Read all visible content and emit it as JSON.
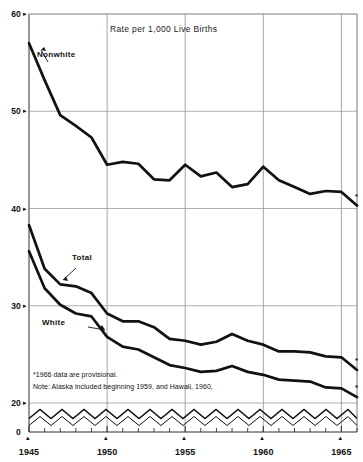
{
  "chart_data": {
    "type": "line",
    "title": "Rate per 1,000 Live Births",
    "xlabel": "",
    "ylabel": "",
    "xlim": [
      1945,
      1966
    ],
    "ylim": [
      20,
      60
    ],
    "y_broken_below": 20,
    "grid": true,
    "legend_position": "inline-annotations",
    "yticks": [
      "60",
      "50",
      "40",
      "30",
      "20",
      "0"
    ],
    "ytick_values": [
      60,
      50,
      40,
      30,
      20,
      0
    ],
    "xticks": [
      "1945",
      "1950",
      "1955",
      "1960",
      "1965"
    ],
    "xtick_values": [
      1945,
      1950,
      1955,
      1960,
      1965
    ],
    "x": [
      1945,
      1946,
      1947,
      1948,
      1949,
      1950,
      1951,
      1952,
      1953,
      1954,
      1955,
      1956,
      1957,
      1958,
      1959,
      1960,
      1961,
      1962,
      1963,
      1964,
      1965,
      1966
    ],
    "series": [
      {
        "name": "Nonwhite",
        "color": "#111111",
        "values": [
          57.0,
          53.2,
          49.6,
          48.5,
          47.3,
          44.5,
          44.8,
          44.6,
          43.0,
          42.9,
          44.5,
          43.3,
          43.7,
          42.2,
          42.5,
          44.3,
          42.9,
          42.2,
          41.5,
          41.8,
          41.7,
          40.3
        ]
      },
      {
        "name": "Total",
        "color": "#111111",
        "values": [
          38.3,
          33.8,
          32.2,
          32.0,
          31.3,
          29.2,
          28.4,
          28.4,
          27.8,
          26.6,
          26.4,
          26.0,
          26.3,
          27.1,
          26.4,
          26.0,
          25.3,
          25.3,
          25.2,
          24.8,
          24.7,
          23.4
        ]
      },
      {
        "name": "White",
        "color": "#111111",
        "values": [
          35.6,
          31.8,
          30.1,
          29.2,
          28.9,
          26.8,
          25.8,
          25.5,
          24.7,
          23.9,
          23.6,
          23.2,
          23.3,
          23.8,
          23.2,
          22.9,
          22.4,
          22.3,
          22.2,
          21.6,
          21.5,
          20.6
        ]
      }
    ],
    "annotations": [
      {
        "text": "Nonwhite",
        "x": 1947.8,
        "y": 55.4
      },
      {
        "text": "Total",
        "x": 1947.7,
        "y": 33.8
      },
      {
        "text": "White",
        "x": 1947.4,
        "y": 28.3
      }
    ],
    "markers": [
      {
        "text": "*",
        "series": "Nonwhite",
        "x": 1966
      },
      {
        "text": "*",
        "series": "Total",
        "x": 1966
      },
      {
        "text": "*",
        "series": "White",
        "x": 1966
      }
    ],
    "footnotes": [
      "*1966 data are provisional.",
      "Note: Alaska included beginning 1959, and Hawaii, 1960,"
    ]
  },
  "axis": {
    "ytick_marks": [
      "▸",
      "▸",
      "▸",
      "▸",
      "▸"
    ],
    "xtick_marks": [
      "▴",
      "▴",
      "▴",
      "▴",
      "▴"
    ]
  },
  "colors": {
    "line": "#111111",
    "grid": "#9a9a9a",
    "axis": "#555555",
    "background": "#ffffff"
  }
}
